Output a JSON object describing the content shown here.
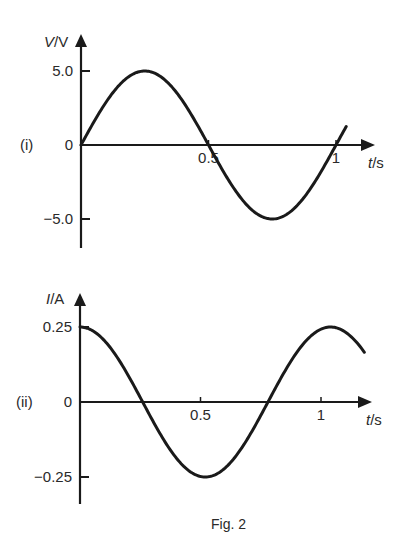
{
  "figure": {
    "caption": "Fig. 2",
    "ink_color": "#1a1a1a",
    "background": "#ffffff"
  },
  "chart_data": [
    {
      "id": "i",
      "panel_label": "(i)",
      "type": "line",
      "title": "",
      "xlabel_var": "t",
      "xlabel_unit": "/s",
      "ylabel_var": "V",
      "ylabel_unit": "/V",
      "x_ticks": [
        {
          "value": 0.5,
          "label": "0.5"
        },
        {
          "value": 1,
          "label": "1"
        }
      ],
      "y_ticks": [
        {
          "value": 5.0,
          "label": "5.0"
        },
        {
          "value": 0,
          "label": "0"
        },
        {
          "value": -5.0,
          "label": "−5.0"
        }
      ],
      "xlim": [
        0,
        1.15
      ],
      "ylim": [
        -7,
        7.3
      ],
      "grid": false,
      "function": "sine",
      "amplitude": 5.0,
      "period": 1.0,
      "phase": 0,
      "x_range": [
        0,
        1.04
      ],
      "key_points": [
        {
          "t": 0,
          "y": 0
        },
        {
          "t": 0.25,
          "y": 5.0
        },
        {
          "t": 0.5,
          "y": 0
        },
        {
          "t": 0.75,
          "y": -5.0
        },
        {
          "t": 1.0,
          "y": 0
        }
      ]
    },
    {
      "id": "ii",
      "panel_label": "(ii)",
      "type": "line",
      "title": "",
      "xlabel_var": "t",
      "xlabel_unit": "/s",
      "ylabel_var": "I",
      "ylabel_unit": "/A",
      "x_ticks": [
        {
          "value": 0.5,
          "label": "0.5"
        },
        {
          "value": 1,
          "label": "1"
        }
      ],
      "y_ticks": [
        {
          "value": 0.25,
          "label": "0.25"
        },
        {
          "value": 0,
          "label": "0"
        },
        {
          "value": -0.25,
          "label": "−0.25"
        }
      ],
      "xlim": [
        0,
        1.22
      ],
      "ylim": [
        -0.33,
        0.36
      ],
      "grid": false,
      "function": "cosine",
      "amplitude": 0.25,
      "period": 1.04,
      "phase": 0,
      "x_range": [
        0,
        1.18
      ],
      "key_points": [
        {
          "t": 0,
          "y": 0.25
        },
        {
          "t": 0.26,
          "y": 0
        },
        {
          "t": 0.52,
          "y": -0.25
        },
        {
          "t": 0.78,
          "y": 0
        },
        {
          "t": 1.04,
          "y": 0.25
        }
      ]
    }
  ]
}
